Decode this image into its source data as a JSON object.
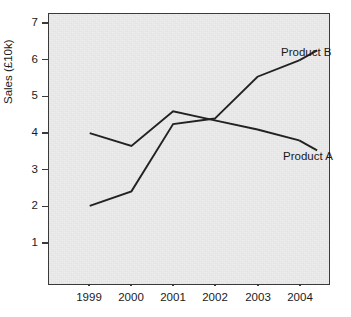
{
  "chart_data": {
    "type": "line",
    "title": "",
    "subtitle": "",
    "xlabel": "",
    "ylabel": "Sales  (£10k)",
    "categories": [
      "1999",
      "2000",
      "2001",
      "2002",
      "2003",
      "2004"
    ],
    "x": [
      1999,
      2000,
      2001,
      2002,
      2003,
      2004
    ],
    "series": [
      {
        "name": "Product A",
        "values": [
          4.0,
          3.65,
          4.6,
          4.35,
          4.1,
          3.8
        ],
        "color": "#222222",
        "label_position": "right-end"
      },
      {
        "name": "Product B",
        "values": [
          2.0,
          2.4,
          4.25,
          4.4,
          5.55,
          6.0
        ],
        "color": "#222222",
        "label_position": "right-end"
      }
    ],
    "ylim": [
      0,
      7.35
    ],
    "xlim": [
      1998.5,
      2004.7
    ],
    "ytick_labels": [
      "7",
      "6",
      "5",
      "4",
      "3",
      "2",
      "1"
    ],
    "ytick_values": [
      7,
      6,
      5,
      4,
      3,
      2,
      1
    ],
    "xtick_labels": [
      "1999",
      "2000",
      "2001",
      "2002",
      "2003",
      "2004"
    ],
    "grid": false,
    "legend": "none",
    "annotations": [
      "Product B",
      "Product A"
    ],
    "plot_background": "#ededed",
    "axis_color": "#3a3a3a"
  }
}
